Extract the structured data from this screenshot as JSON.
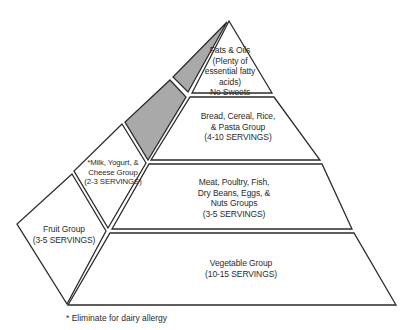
{
  "diagram": {
    "colors": {
      "stroke": "#2b2b2b",
      "fill_white": "#ffffff",
      "fill_gray": "#a9a9a9",
      "text": "#2b2b2b"
    },
    "tiers": [
      {
        "id": "fats",
        "lines": [
          "Fats & Oils",
          "(Plenty of",
          "essential fatty",
          "acids)",
          "No Sweets"
        ]
      },
      {
        "id": "bread",
        "lines": [
          "Bread, Cereal, Rice,",
          "& Pasta Group",
          "(4-10 SERVINGS)"
        ]
      },
      {
        "id": "meat",
        "lines": [
          "Meat, Poultry, Fish,",
          "Dry Beans, Eggs, &",
          "Nuts Groups",
          "(3-5 SERVINGS)"
        ]
      },
      {
        "id": "vegetable",
        "lines": [
          "Vegetable Group",
          "(10-15 SERVINGS)"
        ]
      }
    ],
    "side_faces": [
      {
        "id": "milk",
        "lines": [
          "*Milk, Yogurt, &",
          "Cheese Group",
          "(2-3 SERVINGS)"
        ]
      },
      {
        "id": "fruit",
        "lines": [
          "Fruit Group",
          "(3-5 SERVINGS)"
        ]
      }
    ],
    "footnote": "* Eliminate for dairy allergy"
  }
}
